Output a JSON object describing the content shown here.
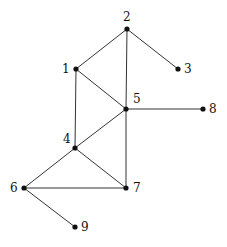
{
  "graph": {
    "nodes": [
      {
        "id": "1",
        "label": "1",
        "x": 76,
        "y": 69,
        "lx": 62,
        "ly": 73
      },
      {
        "id": "2",
        "label": "2",
        "x": 127,
        "y": 29,
        "lx": 123,
        "ly": 21
      },
      {
        "id": "3",
        "label": "3",
        "x": 178,
        "y": 69,
        "lx": 184,
        "ly": 73
      },
      {
        "id": "4",
        "label": "4",
        "x": 75,
        "y": 148,
        "lx": 63,
        "ly": 143
      },
      {
        "id": "5",
        "label": "5",
        "x": 126,
        "y": 109,
        "lx": 133,
        "ly": 103
      },
      {
        "id": "6",
        "label": "6",
        "x": 24,
        "y": 188,
        "lx": 10,
        "ly": 192
      },
      {
        "id": "7",
        "label": "7",
        "x": 126,
        "y": 188,
        "lx": 133,
        "ly": 192
      },
      {
        "id": "8",
        "label": "8",
        "x": 203,
        "y": 109,
        "lx": 209,
        "ly": 113
      },
      {
        "id": "9",
        "label": "9",
        "x": 75,
        "y": 227,
        "lx": 81,
        "ly": 231
      }
    ],
    "edges": [
      [
        "1",
        "2"
      ],
      [
        "2",
        "3"
      ],
      [
        "2",
        "5"
      ],
      [
        "1",
        "5"
      ],
      [
        "1",
        "4"
      ],
      [
        "5",
        "8"
      ],
      [
        "5",
        "4"
      ],
      [
        "5",
        "7"
      ],
      [
        "4",
        "6"
      ],
      [
        "4",
        "7"
      ],
      [
        "6",
        "7"
      ],
      [
        "6",
        "9"
      ]
    ],
    "colors": {
      "node": "#111111",
      "edge": "#333333",
      "label": "#111111"
    }
  }
}
